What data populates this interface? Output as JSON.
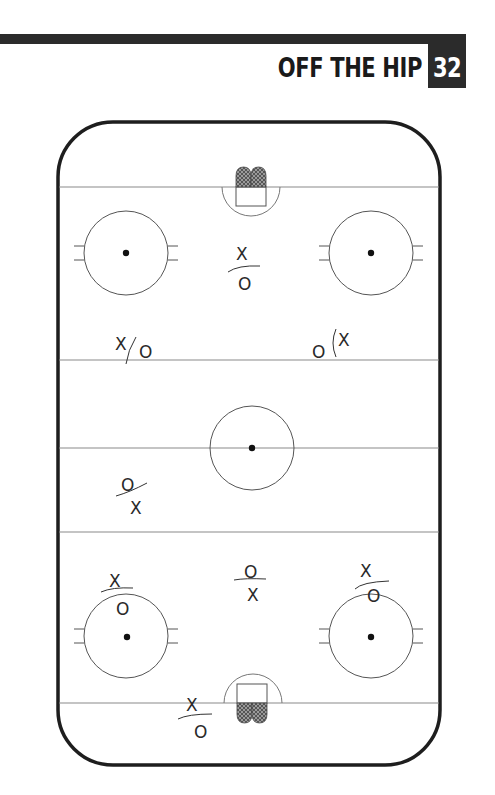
{
  "header": {
    "title": "OFF THE HIP",
    "page_number": "32",
    "bar_color": "#2b2b2b"
  },
  "diagram": {
    "type": "hockey-rink-faceoff-formation",
    "rink": {
      "left": 58,
      "top": 122,
      "right": 440,
      "bottom": 765,
      "corner_radius": 55
    },
    "lines": {
      "top_goal_line_y": 187,
      "top_blue_line_y": 360,
      "center_line_y": 448,
      "bottom_blue_line_y": 532,
      "bottom_goal_line_y": 703
    },
    "faceoff_circles": [
      {
        "name": "top-left",
        "cx": 126,
        "cy": 253,
        "r": 42
      },
      {
        "name": "top-right",
        "cx": 371,
        "cy": 253,
        "r": 42
      },
      {
        "name": "center",
        "cx": 252,
        "cy": 448,
        "r": 42
      },
      {
        "name": "bottom-left",
        "cx": 126,
        "cy": 636,
        "r": 42
      },
      {
        "name": "bottom-right",
        "cx": 371,
        "cy": 636,
        "r": 42
      }
    ],
    "players": [
      {
        "top": "X",
        "bottom": "O",
        "position": "top-slot"
      },
      {
        "left": "X",
        "right": "O",
        "position": "top-left-point"
      },
      {
        "left": "O",
        "right": "X",
        "position": "top-right-point"
      },
      {
        "top": "O",
        "bottom": "X",
        "position": "neutral-left"
      },
      {
        "top": "X",
        "bottom": "O",
        "position": "bottom-left-circle"
      },
      {
        "top": "O",
        "bottom": "X",
        "position": "bottom-slot"
      },
      {
        "top": "X",
        "bottom": "O",
        "position": "bottom-right-circle"
      },
      {
        "top": "X",
        "bottom": "O",
        "position": "bottom-goal-line"
      }
    ],
    "labels": {
      "x": "X",
      "o": "O"
    }
  }
}
